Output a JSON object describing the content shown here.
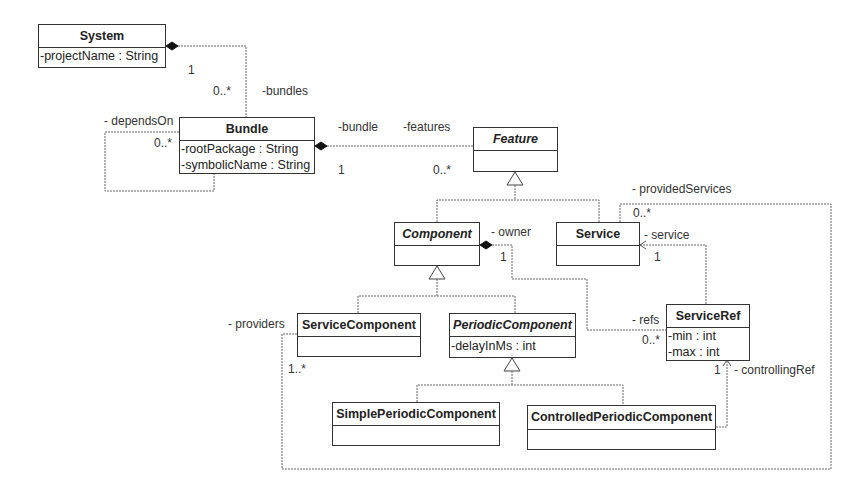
{
  "diagram": {
    "type": "uml-class-diagram",
    "classes": {
      "system": {
        "name": "System",
        "abstract": false,
        "attributes": [
          "-projectName : String"
        ]
      },
      "bundle": {
        "name": "Bundle",
        "abstract": false,
        "attributes": [
          "-rootPackage : String",
          "-symbolicName : String"
        ]
      },
      "feature": {
        "name": "Feature",
        "abstract": true,
        "attributes": []
      },
      "component": {
        "name": "Component",
        "abstract": true,
        "attributes": []
      },
      "service": {
        "name": "Service",
        "abstract": false,
        "attributes": []
      },
      "service_component": {
        "name": "ServiceComponent",
        "abstract": false,
        "attributes": []
      },
      "periodic_component": {
        "name": "PeriodicComponent",
        "abstract": true,
        "attributes": [
          "-delayInMs : int"
        ]
      },
      "service_ref": {
        "name": "ServiceRef",
        "abstract": false,
        "attributes": [
          "-min : int",
          "-max : int"
        ]
      },
      "simple_periodic_component": {
        "name": "SimplePeriodicComponent",
        "abstract": false,
        "attributes": []
      },
      "controlled_periodic_component": {
        "name": "ControlledPeriodicComponent",
        "abstract": false,
        "attributes": []
      }
    },
    "labels": {
      "system_bundles_mult_1": "1",
      "system_bundles_mult_0n": "0..*",
      "bundles_role": "-bundles",
      "depends_on_role": "- dependsOn",
      "depends_on_mult": "0..*",
      "bundle_role": "-bundle",
      "features_role": "-features",
      "bundle_features_mult_1": "1",
      "bundle_features_mult_0n": "0..*",
      "provided_services_role": "- providedServices",
      "provided_services_mult": "0..*",
      "service_role": "- service",
      "service_mult": "1",
      "owner_role": "- owner",
      "owner_mult": "1",
      "refs_role": "- refs",
      "refs_mult": "0..*",
      "providers_role": "- providers",
      "providers_mult": "1..*",
      "controlling_ref_mult": "1",
      "controlling_ref_role": "- controllingRef"
    },
    "relationships": [
      {
        "kind": "composition",
        "from": "System",
        "to": "Bundle",
        "role": "-bundles",
        "multiplicity": [
          "1",
          "0..*"
        ]
      },
      {
        "kind": "association",
        "from": "Bundle",
        "to": "Bundle",
        "role": "- dependsOn",
        "multiplicity": "0..*"
      },
      {
        "kind": "composition",
        "from": "Bundle",
        "to": "Feature",
        "roles": [
          "-bundle",
          "-features"
        ],
        "multiplicity": [
          "1",
          "0..*"
        ]
      },
      {
        "kind": "generalization",
        "from": "Component",
        "to": "Feature"
      },
      {
        "kind": "generalization",
        "from": "Service",
        "to": "Feature"
      },
      {
        "kind": "generalization",
        "from": "ServiceComponent",
        "to": "Component"
      },
      {
        "kind": "generalization",
        "from": "PeriodicComponent",
        "to": "Component"
      },
      {
        "kind": "generalization",
        "from": "SimplePeriodicComponent",
        "to": "PeriodicComponent"
      },
      {
        "kind": "generalization",
        "from": "ControlledPeriodicComponent",
        "to": "PeriodicComponent"
      },
      {
        "kind": "composition",
        "from": "Component",
        "to": "ServiceRef",
        "roles": [
          "- owner",
          "- refs"
        ],
        "multiplicity": [
          "1",
          "0..*"
        ]
      },
      {
        "kind": "directed-association",
        "from": "ServiceRef",
        "to": "Service",
        "role": "- service",
        "multiplicity": "1"
      },
      {
        "kind": "association",
        "from": "ServiceComponent",
        "to": "Service",
        "roles": [
          "- providers",
          "- providedServices"
        ],
        "multiplicity": [
          "1..*",
          "0..*"
        ]
      },
      {
        "kind": "directed-association",
        "from": "ControlledPeriodicComponent",
        "to": "ServiceRef",
        "role": "- controllingRef",
        "multiplicity": "1"
      }
    ]
  },
  "colors": {
    "line": "#555555",
    "border": "#333333",
    "background": "#ffffff"
  }
}
